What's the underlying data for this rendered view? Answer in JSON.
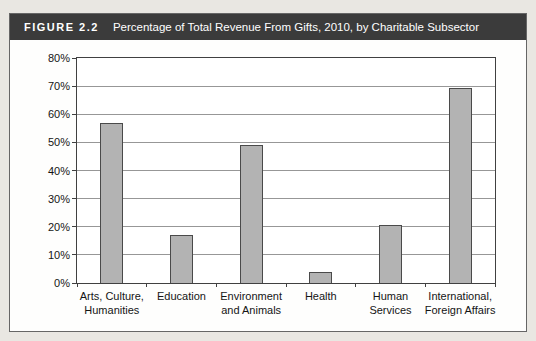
{
  "figure": {
    "label": "FIGURE 2.2",
    "title": "Percentage of Total Revenue From Gifts, 2010, by Charitable Subsector"
  },
  "chart_data": {
    "type": "bar",
    "title": "Percentage of Total Revenue From Gifts, 2010, by Charitable Subsector",
    "categories": [
      "Arts, Culture,\nHumanities",
      "Education",
      "Environment\nand Animals",
      "Health",
      "Human\nServices",
      "International,\nForeign Affairs"
    ],
    "values": [
      57,
      17,
      49,
      4,
      20.5,
      69.5
    ],
    "xlabel": "",
    "ylabel": "",
    "ylim": [
      0,
      80
    ],
    "y_ticks": [
      "0%",
      "10%",
      "20%",
      "30%",
      "40%",
      "50%",
      "60%",
      "70%",
      "80%"
    ],
    "grid": true,
    "legend": false,
    "bar_fill": "#b3b3b3",
    "bar_border": "#4a4a4a"
  },
  "colors": {
    "header_bg": "#3b3b3b",
    "header_text": "#ffffff",
    "page_bg": "#e9e7e2",
    "figure_bg": "#fefefd",
    "plot_border": "#404040",
    "gridline": "#979797",
    "axis_text": "#151515"
  }
}
